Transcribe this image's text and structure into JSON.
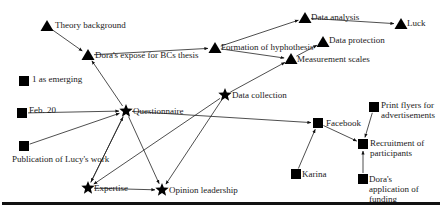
{
  "diagram": {
    "type": "network-graph",
    "shape_legend": {
      "triangle": "triangle",
      "square": "square",
      "star": "star"
    },
    "nodes": [
      {
        "id": "theory",
        "label": "Theory background",
        "shape": "triangle",
        "x": 47,
        "y": 26
      },
      {
        "id": "expose",
        "label": "Dora's exposé for BCs thesis",
        "shape": "triangle",
        "x": 88,
        "y": 55
      },
      {
        "id": "emerging",
        "label": "1 as emerging",
        "shape": "square",
        "x": 24,
        "y": 81
      },
      {
        "id": "feb20",
        "label": "Feb. 20",
        "shape": "square",
        "x": 22,
        "y": 113
      },
      {
        "id": "questionnaire",
        "label": "Questionnaire",
        "shape": "star",
        "x": 126,
        "y": 111
      },
      {
        "id": "lucy",
        "label": "Publication of Lucy's work",
        "shape": "square",
        "x": 24,
        "y": 146
      },
      {
        "id": "expertise",
        "label": "Expertise",
        "shape": "star",
        "x": 88,
        "y": 188
      },
      {
        "id": "opinion",
        "label": "Opinion leadership",
        "shape": "star",
        "x": 162,
        "y": 190
      },
      {
        "id": "datacollection",
        "label": "Data collection",
        "shape": "star",
        "x": 225,
        "y": 95
      },
      {
        "id": "hypothesis",
        "label": "Formation of hyphothesis",
        "shape": "triangle",
        "x": 215,
        "y": 48
      },
      {
        "id": "dataanalysis",
        "label": "Data analysis",
        "shape": "triangle",
        "x": 305,
        "y": 18
      },
      {
        "id": "luck",
        "label": "Luck",
        "shape": "triangle",
        "x": 401,
        "y": 24
      },
      {
        "id": "dataprotection",
        "label": "Data protection",
        "shape": "triangle",
        "x": 323,
        "y": 42
      },
      {
        "id": "measurement",
        "label": "Measurement scales",
        "shape": "triangle",
        "x": 291,
        "y": 59
      },
      {
        "id": "facebook",
        "label": "Facebook",
        "shape": "square",
        "x": 318,
        "y": 123
      },
      {
        "id": "flyers",
        "label": "Print flyers for advertisements",
        "shape": "square",
        "x": 374,
        "y": 107
      },
      {
        "id": "recruitment",
        "label": "Recruitment of participants",
        "shape": "square",
        "x": 363,
        "y": 144
      },
      {
        "id": "karina",
        "label": "Karina",
        "shape": "square",
        "x": 296,
        "y": 174
      },
      {
        "id": "funding",
        "label": "Dora's application of funding",
        "shape": "square",
        "x": 363,
        "y": 179
      }
    ],
    "edges": [
      {
        "from": "theory",
        "to": "expose"
      },
      {
        "from": "questionnaire",
        "to": "expose"
      },
      {
        "from": "expose",
        "to": "hypothesis"
      },
      {
        "from": "hypothesis",
        "to": "dataanalysis"
      },
      {
        "from": "hypothesis",
        "to": "measurement"
      },
      {
        "from": "dataanalysis",
        "to": "luck"
      },
      {
        "from": "measurement",
        "to": "dataprotection"
      },
      {
        "from": "datacollection",
        "to": "measurement"
      },
      {
        "from": "feb20",
        "to": "questionnaire"
      },
      {
        "from": "lucy",
        "to": "questionnaire"
      },
      {
        "from": "expertise",
        "to": "questionnaire"
      },
      {
        "from": "questionnaire",
        "to": "expertise"
      },
      {
        "from": "questionnaire",
        "to": "opinion"
      },
      {
        "from": "expertise",
        "to": "opinion"
      },
      {
        "from": "datacollection",
        "to": "expertise"
      },
      {
        "from": "datacollection",
        "to": "opinion"
      },
      {
        "from": "questionnaire",
        "to": "facebook"
      },
      {
        "from": "karina",
        "to": "facebook"
      },
      {
        "from": "facebook",
        "to": "recruitment"
      },
      {
        "from": "flyers",
        "to": "recruitment"
      },
      {
        "from": "funding",
        "to": "recruitment"
      }
    ]
  },
  "labels": {
    "theory": "Theory background",
    "expose": "Dora's exposé for BCs thesis",
    "emerging": "1 as emerging",
    "feb20": "Feb. 20",
    "questionnaire": "Questionnaire",
    "lucy": "Publication of Lucy's work",
    "expertise": "Expertise",
    "opinion": "Opinion leadership",
    "datacollection": "Data collection",
    "hypothesis": "Formation of hyphothesis",
    "dataanalysis": "Data analysis",
    "luck": "Luck",
    "dataprotection": "Data protection",
    "measurement": "Measurement scales",
    "facebook": "Facebook",
    "flyers": "Print flyers for advertisements",
    "recruitment": "Recruitment of participants",
    "karina": "Karina",
    "funding": "Dora's application of funding"
  }
}
